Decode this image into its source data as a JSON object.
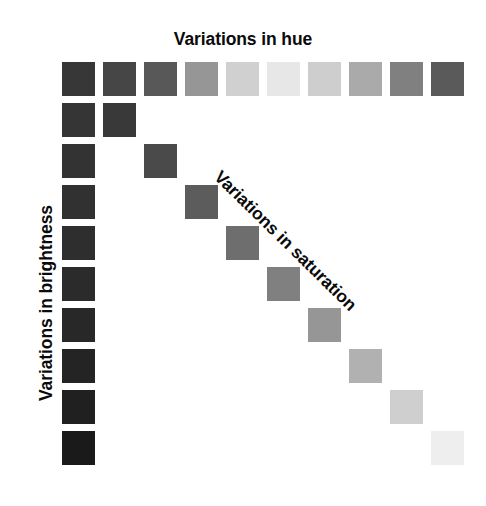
{
  "figure": {
    "background_color": "#ffffff",
    "width": 486,
    "height": 506
  },
  "labels": {
    "hue": "Variations in hue",
    "brightness": "Variations in brightness",
    "saturation": "Variations in saturation",
    "text_color": "#0a0a0a"
  },
  "chart_data": {
    "type": "heatmap",
    "title": "Variations in hue",
    "xlabel": "Variations in hue",
    "ylabel": "Variations in brightness",
    "annotations": [
      "Variations in saturation"
    ],
    "grid": false,
    "legend": "none",
    "swatch_size_px": 33,
    "pitch_px": 41,
    "origin_px": [
      62,
      62
    ],
    "series": [
      {
        "name": "Variations in hue",
        "axis": "top-row",
        "count": 10,
        "values": [
          {
            "index": 1,
            "gray": 55,
            "color": "#373737",
            "col": 0,
            "row": 0
          },
          {
            "index": 2,
            "gray": 70,
            "color": "#464646",
            "col": 1,
            "row": 0
          },
          {
            "index": 3,
            "gray": 88,
            "color": "#585858",
            "col": 2,
            "row": 0
          },
          {
            "index": 4,
            "gray": 150,
            "color": "#969696",
            "col": 3,
            "row": 0
          },
          {
            "index": 5,
            "gray": 208,
            "color": "#d0d0d0",
            "col": 4,
            "row": 0
          },
          {
            "index": 6,
            "gray": 231,
            "color": "#e7e7e7",
            "col": 5,
            "row": 0
          },
          {
            "index": 7,
            "gray": 206,
            "color": "#cecece",
            "col": 6,
            "row": 0
          },
          {
            "index": 8,
            "gray": 170,
            "color": "#aaaaaa",
            "col": 7,
            "row": 0
          },
          {
            "index": 9,
            "gray": 128,
            "color": "#808080",
            "col": 8,
            "row": 0
          },
          {
            "index": 10,
            "gray": 90,
            "color": "#5a5a5a",
            "col": 9,
            "row": 0
          }
        ]
      },
      {
        "name": "Variations in brightness",
        "axis": "left-column",
        "count": 10,
        "values": [
          {
            "index": 1,
            "gray": 55,
            "color": "#373737",
            "col": 0,
            "row": 0
          },
          {
            "index": 2,
            "gray": 53,
            "color": "#353535",
            "col": 0,
            "row": 1
          },
          {
            "index": 3,
            "gray": 51,
            "color": "#333333",
            "col": 0,
            "row": 2
          },
          {
            "index": 4,
            "gray": 49,
            "color": "#313131",
            "col": 0,
            "row": 3
          },
          {
            "index": 5,
            "gray": 46,
            "color": "#2e2e2e",
            "col": 0,
            "row": 4
          },
          {
            "index": 6,
            "gray": 43,
            "color": "#2b2b2b",
            "col": 0,
            "row": 5
          },
          {
            "index": 7,
            "gray": 40,
            "color": "#282828",
            "col": 0,
            "row": 6
          },
          {
            "index": 8,
            "gray": 36,
            "color": "#242424",
            "col": 0,
            "row": 7
          },
          {
            "index": 9,
            "gray": 32,
            "color": "#202020",
            "col": 0,
            "row": 8
          },
          {
            "index": 10,
            "gray": 26,
            "color": "#1a1a1a",
            "col": 0,
            "row": 9
          }
        ]
      },
      {
        "name": "Variations in saturation",
        "axis": "diagonal",
        "count": 10,
        "values": [
          {
            "index": 1,
            "gray": 55,
            "color": "#373737",
            "col": 0,
            "row": 0
          },
          {
            "index": 2,
            "gray": 57,
            "color": "#393939",
            "col": 1,
            "row": 1
          },
          {
            "index": 3,
            "gray": 74,
            "color": "#4a4a4a",
            "col": 2,
            "row": 2
          },
          {
            "index": 4,
            "gray": 92,
            "color": "#5c5c5c",
            "col": 3,
            "row": 3
          },
          {
            "index": 5,
            "gray": 110,
            "color": "#6e6e6e",
            "col": 4,
            "row": 4
          },
          {
            "index": 6,
            "gray": 128,
            "color": "#808080",
            "col": 5,
            "row": 5
          },
          {
            "index": 7,
            "gray": 150,
            "color": "#969696",
            "col": 6,
            "row": 6
          },
          {
            "index": 8,
            "gray": 177,
            "color": "#b1b1b1",
            "col": 7,
            "row": 7
          },
          {
            "index": 9,
            "gray": 207,
            "color": "#cfcfcf",
            "col": 8,
            "row": 8
          },
          {
            "index": 10,
            "gray": 238,
            "color": "#eeeeee",
            "col": 9,
            "row": 9
          }
        ]
      }
    ]
  }
}
